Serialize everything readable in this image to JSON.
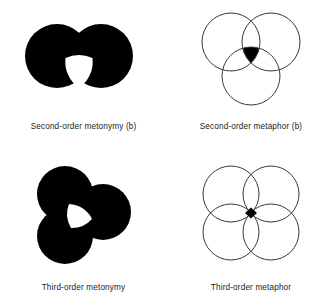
{
  "figure": {
    "background_color": "#ffffff",
    "fill_color": "#000000",
    "stroke_color": "#3a3a3a",
    "hole_color": "#ffffff",
    "panels": [
      {
        "id": "second-order-metonymy-b",
        "caption": "Second-order metonymy (b)",
        "style": "filled",
        "circle_count": 2,
        "shaded_region": "union-of-two-circles-minus-central-curved-triangle",
        "hole": "curved-triangle",
        "circles": [
          {
            "cx": 46,
            "cy": 44,
            "r": 32
          },
          {
            "cx": 84,
            "cy": 44,
            "r": 32
          }
        ]
      },
      {
        "id": "second-order-metaphor-b",
        "caption": "Second-order metaphor (b)",
        "style": "outline",
        "circle_count": 3,
        "shaded_region": "triple-intersection",
        "hole": "none",
        "circles": [
          {
            "cx": 47,
            "cy": 38,
            "r": 29
          },
          {
            "cx": 90,
            "cy": 38,
            "r": 29
          },
          {
            "cx": 68,
            "cy": 72,
            "r": 29
          }
        ]
      },
      {
        "id": "third-order-metonymy",
        "caption": "Third-order metonymy",
        "style": "filled",
        "circle_count": 3,
        "shaded_region": "union-of-three-circles-minus-central-curved-triangle",
        "hole": "curved-triangle",
        "circles": [
          {
            "cx": 52,
            "cy": 36,
            "r": 28
          },
          {
            "cx": 90,
            "cy": 52,
            "r": 28
          },
          {
            "cx": 52,
            "cy": 78,
            "r": 28
          }
        ]
      },
      {
        "id": "third-order-metaphor",
        "caption": "Third-order metaphor",
        "style": "outline",
        "circle_count": 4,
        "shaded_region": "central-diamond-quadruple-intersection",
        "hole": "none",
        "circles": [
          {
            "cx": 48,
            "cy": 34,
            "r": 28
          },
          {
            "cx": 90,
            "cy": 34,
            "r": 28
          },
          {
            "cx": 48,
            "cy": 74,
            "r": 28
          },
          {
            "cx": 90,
            "cy": 74,
            "r": 28
          }
        ]
      }
    ]
  }
}
